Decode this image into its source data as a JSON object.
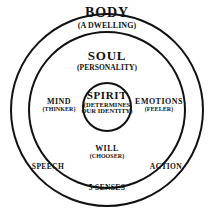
{
  "diagram": {
    "background_color": "#ffffff",
    "line_color": "#111111",
    "rings": {
      "outer": {
        "name": "BODY",
        "subtitle": "(A DWELLING)"
      },
      "middle": {
        "name": "SOUL",
        "subtitle": "(PERSONALITY)"
      },
      "inner": {
        "name": "SPIRIT",
        "subtitle_line1": "(DETERMINES",
        "subtitle_line2": "OUR IDENTITY)"
      }
    },
    "soul_faculties": [
      {
        "name": "MIND",
        "subtitle": "(THINKER)"
      },
      {
        "name": "EMOTIONS",
        "subtitle": "(FEELER)"
      },
      {
        "name": "WILL",
        "subtitle": "(CHOOSER)"
      }
    ],
    "body_functions": [
      {
        "name": "SPEECH"
      },
      {
        "name": "ACTION"
      },
      {
        "name": "5 SENSES"
      }
    ]
  }
}
